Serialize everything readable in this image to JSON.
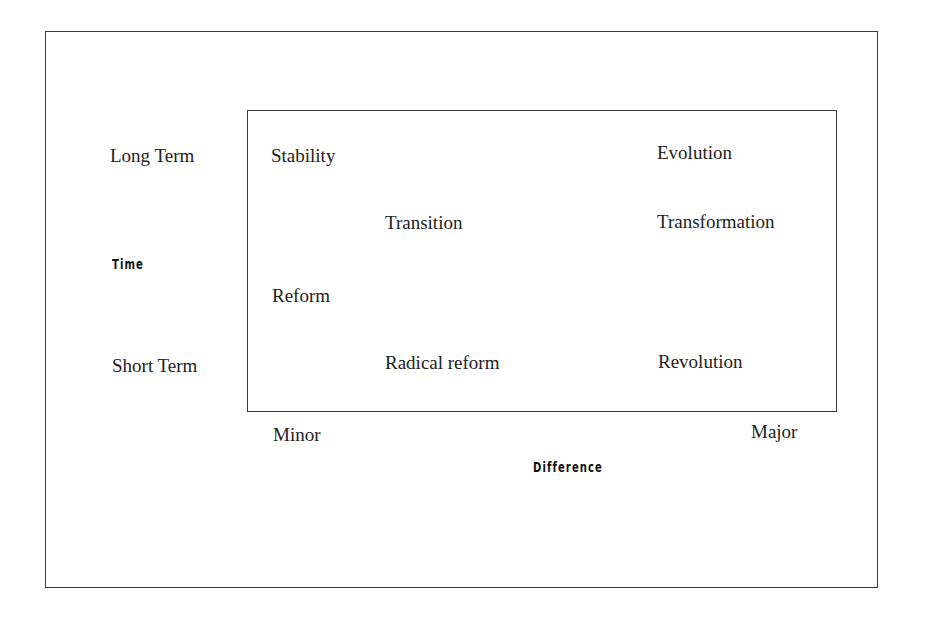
{
  "diagram": {
    "y_axis": {
      "title": "Time",
      "top_label": "Long Term",
      "bottom_label": "Short Term"
    },
    "x_axis": {
      "title": "Difference",
      "left_label": "Minor",
      "right_label": "Major"
    },
    "cells": [
      {
        "label": "Stability",
        "time": "Long Term",
        "difference": "Minor"
      },
      {
        "label": "Evolution",
        "time": "Long Term",
        "difference": "Major"
      },
      {
        "label": "Transition",
        "time": "Mid",
        "difference": "Mid"
      },
      {
        "label": "Transformation",
        "time": "Mid",
        "difference": "Major"
      },
      {
        "label": "Reform",
        "time": "Mid-Short",
        "difference": "Minor"
      },
      {
        "label": "Radical reform",
        "time": "Short Term",
        "difference": "Mid"
      },
      {
        "label": "Revolution",
        "time": "Short Term",
        "difference": "Major"
      }
    ]
  }
}
